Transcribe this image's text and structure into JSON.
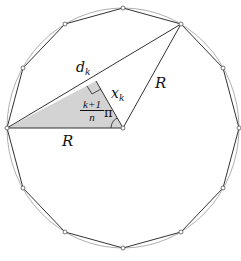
{
  "diagram": {
    "type": "regular-polygon-inscribed-in-circle",
    "polygon_sides": 12,
    "center": [
      123,
      128
    ],
    "radius_x": 116,
    "radius_y": 120,
    "colors": {
      "stroke": "#333333",
      "circle": "#9a9a9a",
      "shaded_triangle": "#d3d3d3",
      "vertex_fill": "#ffffff"
    },
    "labels": {
      "chord": "d",
      "chord_sub": "k",
      "altitude": "x",
      "altitude_sub": "k",
      "radius_right": "R",
      "radius_bottom": "R",
      "angle_num": "k+1",
      "angle_den": "n",
      "angle_pi": "π"
    }
  }
}
